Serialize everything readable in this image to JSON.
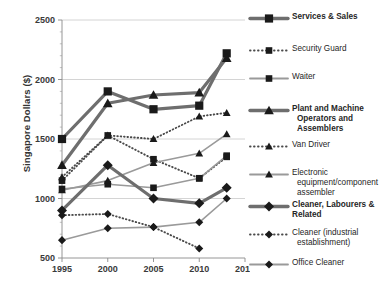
{
  "chart_data": {
    "type": "line",
    "title": "",
    "xlabel": "",
    "ylabel": "Singapore Dollars ($)",
    "x": [
      1995,
      2000,
      2005,
      2010,
      2013
    ],
    "xticks": [
      1995,
      2000,
      2005,
      2010,
      2015
    ],
    "xlim": [
      1995,
      2015
    ],
    "yticks": [
      500,
      1000,
      1500,
      2000,
      2500
    ],
    "ylim": [
      500,
      2500
    ],
    "grid": "horizontal",
    "legend_position": "right",
    "series": [
      {
        "name": "Services & Sales",
        "marker": "square",
        "style": "solid",
        "weight": "bold",
        "color": "#6e6e6e",
        "marker_color": "#1a1a1a",
        "width": 3.2,
        "x": [
          1995,
          2000,
          2005,
          2010,
          2013
        ],
        "values": [
          1500,
          1900,
          1750,
          1780,
          2220
        ]
      },
      {
        "name": "Security Guard",
        "marker": "square",
        "style": "dotted",
        "weight": "normal",
        "color": "#4a4a4a",
        "marker_color": "#1a1a1a",
        "width": 1.8,
        "x": [
          1995,
          2000,
          2005,
          2010,
          2013
        ],
        "values": [
          1150,
          1530,
          1330,
          1170,
          1350
        ]
      },
      {
        "name": "Waiter",
        "marker": "square",
        "style": "solid",
        "weight": "normal",
        "color": "#9a9a9a",
        "marker_color": "#1a1a1a",
        "width": 1.6,
        "x": [
          1995,
          2000,
          2005,
          2010,
          2013
        ],
        "values": [
          1080,
          1120,
          1090,
          1170,
          1360
        ]
      },
      {
        "name": "Plant and Machine Operators and Assemblers",
        "marker": "triangle",
        "style": "solid",
        "weight": "bold",
        "color": "#6e6e6e",
        "marker_color": "#1a1a1a",
        "width": 3.2,
        "x": [
          1995,
          2000,
          2005,
          2010,
          2013
        ],
        "values": [
          1280,
          1800,
          1870,
          1890,
          2180
        ]
      },
      {
        "name": "Van Driver",
        "marker": "triangle",
        "style": "dotted",
        "weight": "normal",
        "color": "#4a4a4a",
        "marker_color": "#1a1a1a",
        "width": 1.8,
        "x": [
          1995,
          2000,
          2005,
          2010,
          2013
        ],
        "values": [
          1180,
          1530,
          1500,
          1690,
          1720
        ]
      },
      {
        "name": "Electronic equipment/component assembler",
        "marker": "triangle",
        "style": "solid",
        "weight": "normal",
        "color": "#9a9a9a",
        "marker_color": "#1a1a1a",
        "width": 1.6,
        "x": [
          1995,
          2000,
          2005,
          2010,
          2013
        ],
        "values": [
          1070,
          1150,
          1300,
          1380,
          1540
        ]
      },
      {
        "name": "Cleaner, Labourers & Related",
        "marker": "diamond",
        "style": "solid",
        "weight": "bold",
        "color": "#6e6e6e",
        "marker_color": "#1a1a1a",
        "width": 3.2,
        "x": [
          1995,
          2000,
          2005,
          2010,
          2013
        ],
        "values": [
          900,
          1280,
          1000,
          960,
          1090
        ]
      },
      {
        "name": "Cleaner (industrial establishment)",
        "marker": "diamond",
        "style": "dotted",
        "weight": "normal",
        "color": "#4a4a4a",
        "marker_color": "#1a1a1a",
        "width": 1.8,
        "x": [
          1995,
          2000,
          2005,
          2010
        ],
        "values": [
          860,
          870,
          760,
          580
        ]
      },
      {
        "name": "Office Cleaner",
        "marker": "diamond",
        "style": "solid",
        "weight": "normal",
        "color": "#9a9a9a",
        "marker_color": "#1a1a1a",
        "width": 1.6,
        "x": [
          1995,
          2000,
          2005,
          2010,
          2013
        ],
        "values": [
          650,
          750,
          760,
          800,
          1000
        ]
      }
    ]
  },
  "legend": {
    "items": [
      {
        "lines": [
          "Services & Sales"
        ],
        "bold": true
      },
      {
        "lines": [
          "Security Guard"
        ],
        "bold": false
      },
      {
        "lines": [
          "Waiter"
        ],
        "bold": false
      },
      {
        "lines": [
          "Plant and Machine",
          "Operators and Assemblers"
        ],
        "bold": true
      },
      {
        "lines": [
          "Van Driver"
        ],
        "bold": false
      },
      {
        "lines": [
          "Electronic",
          "equipment/component",
          "assembler"
        ],
        "bold": false
      },
      {
        "lines": [
          "Cleaner, Labourers &",
          "Related"
        ],
        "bold": true
      },
      {
        "lines": [
          "Cleaner (industrial",
          "establishment)"
        ],
        "bold": false
      },
      {
        "lines": [
          "Office Cleaner"
        ],
        "bold": false
      }
    ]
  }
}
